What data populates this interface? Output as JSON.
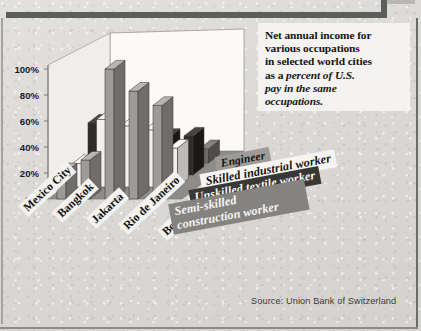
{
  "title": {
    "line1": "Net annual income for",
    "line2": "various occupations",
    "line3": "in selected world cities",
    "line4_plain": "as a ",
    "line4_italic": "percent of U.S.",
    "line5_italic": "pay in the same",
    "line6_italic": "occupations."
  },
  "source": "Source: Union Bank of Switzerland",
  "axis": {
    "yticks": [
      "100%",
      "80%",
      "60%",
      "40%",
      "20%",
      "0%"
    ]
  },
  "chart_data": {
    "type": "bar",
    "title": "Net annual income for various occupations in selected world cities as a percent of U.S. pay in the same occupations.",
    "subtitle": "",
    "xlabel": "",
    "ylabel": "",
    "ylim": [
      0,
      100
    ],
    "ytick_values": [
      0,
      20,
      40,
      60,
      80,
      100
    ],
    "ytick_labels": [
      "0%",
      "20%",
      "40%",
      "60%",
      "80%",
      "100%"
    ],
    "grid": false,
    "legend_position": "inside-right",
    "projection": "3d-grouped-rows",
    "categories": [
      "Mexico City",
      "Bangkok",
      "Jakarta",
      "Rio de Janeiro",
      "Bombay"
    ],
    "series": [
      {
        "name": "Engineer",
        "color": "#9d9b98",
        "side_color": "#6f6d6a",
        "top_color": "#b8b6b3",
        "values": [
          21,
          30,
          100,
          83,
          72
        ]
      },
      {
        "name": "Skilled industrial worker",
        "color": "#f2f1ef",
        "side_color": "#bdbbb8",
        "top_color": "#fbfaf9",
        "values": [
          18,
          52,
          47,
          44,
          30
        ]
      },
      {
        "name": "Unskilled textile worker",
        "color": "#2e2c2a",
        "side_color": "#191817",
        "top_color": "#474442",
        "values": [
          40,
          25,
          17,
          29,
          30
        ]
      },
      {
        "name": "Semi-skilled construction worker",
        "color": "#6c6a67",
        "side_color": "#4e4c4a",
        "top_color": "#858380",
        "values": [
          12,
          11,
          11,
          11,
          11
        ]
      }
    ]
  },
  "legend": {
    "items": [
      {
        "label": "Engineer",
        "bg": "#9d9b98",
        "fg": "#15130f"
      },
      {
        "label": "Skilled industrial worker",
        "bg": "#f6f5f3",
        "fg": "#15130f"
      },
      {
        "label": "Unskilled textile worker",
        "bg": "#3a3835",
        "fg": "#f7f6f4"
      },
      {
        "label": "Semi-skilled construction worker",
        "bg": "#85837f",
        "fg": "#f7f6f4"
      }
    ]
  },
  "colors": {
    "page_bg": "#ddd"
  }
}
